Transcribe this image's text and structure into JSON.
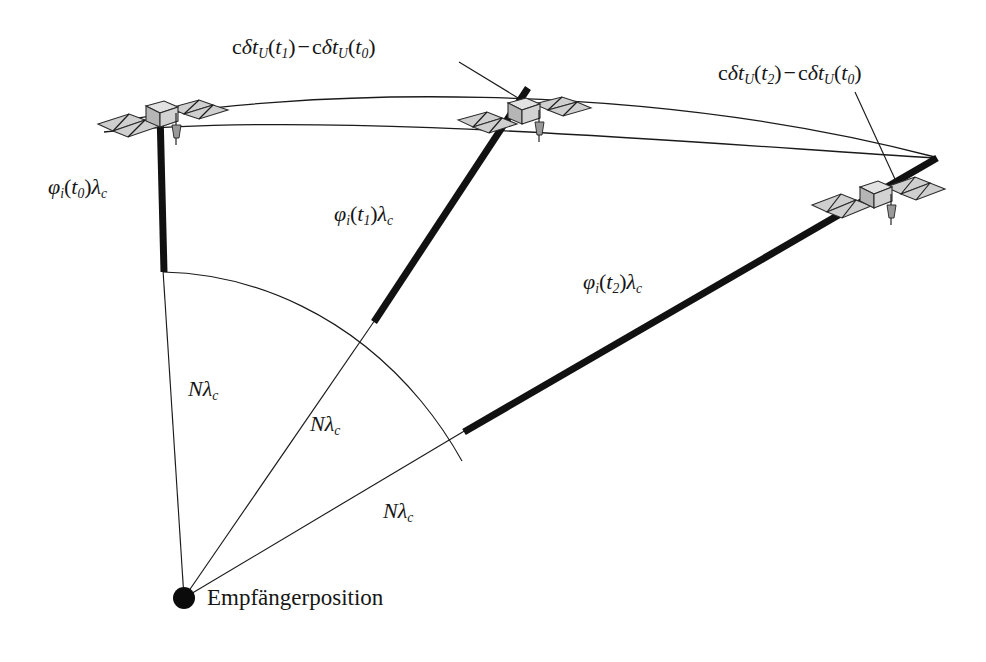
{
  "figure": {
    "name": "carrier-phase-ambiguity-diagram",
    "background_color": "#ffffff",
    "ink_color": "#141414",
    "panel_color": "#cfcfcf"
  },
  "receiver": {
    "dot_label": "Empfängerposition"
  },
  "labels": {
    "clock_offset_t1": {
      "c": "c",
      "delta": "δ",
      "t": "t",
      "sub_U": "U",
      "open": "(",
      "arg1": "t",
      "arg1_sub": "1",
      "close": ")",
      "minus": "−",
      "arg0": "t",
      "arg0_sub": "0",
      "full": "cδt_U(t₁) − cδt_U(t₀)"
    },
    "clock_offset_t2": {
      "full": "cδt_U(t₂) − cδt_U(t₀)"
    },
    "phase_t0": {
      "full": "φ_i(t₀)λ_c"
    },
    "phase_t1": {
      "full": "φ_i(t₁)λ_c"
    },
    "phase_t2": {
      "full": "φ_i(t₂)λ_c"
    },
    "ambiguity": {
      "full": "Nλ_c"
    }
  },
  "label_parts": {
    "phi": "φ",
    "i": "i",
    "lambda": "λ",
    "c": "c",
    "N": "N",
    "t": "t",
    "delta": "δ",
    "U": "U",
    "minus": "−",
    "open_paren": "(",
    "close_paren": ")",
    "sub0": "0",
    "sub1": "1",
    "sub2": "2"
  },
  "epochs": [
    {
      "id": "t0",
      "phase_label": "φ_i(t₀)λ_c",
      "ambiguity_label": "Nλ_c",
      "satellite_name": "satellite-t0"
    },
    {
      "id": "t1",
      "phase_label": "φ_i(t₁)λ_c",
      "ambiguity_label": "Nλ_c",
      "satellite_name": "satellite-t1",
      "clock_label": "cδt_U(t₁) − cδt_U(t₀)"
    },
    {
      "id": "t2",
      "phase_label": "φ_i(t₂)λ_c",
      "ambiguity_label": "Nλ_c",
      "satellite_name": "satellite-t2",
      "clock_label": "cδt_U(t₂) − cδt_U(t₀)"
    }
  ]
}
